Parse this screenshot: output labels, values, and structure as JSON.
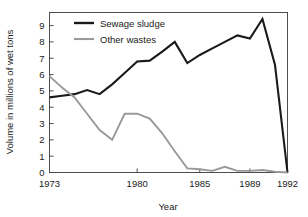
{
  "chart_data": {
    "type": "line",
    "title": "",
    "xlabel": "Year",
    "ylabel": "Volume in millions of wet tons",
    "xlim": [
      1973,
      1992
    ],
    "ylim": [
      0,
      9.8
    ],
    "grid": false,
    "legend_position": "top-left-inside",
    "xticks": [
      1973,
      1980,
      1985,
      1989,
      1992
    ],
    "xtick_labels": [
      "1973",
      "1980",
      "1985",
      "1989",
      "1992"
    ],
    "yticks": [
      0,
      1,
      2,
      3,
      4,
      5,
      6,
      7,
      8,
      9
    ],
    "ytick_labels": [
      "0",
      "1",
      "2",
      "3",
      "4",
      "5",
      "6",
      "7",
      "8",
      "9"
    ],
    "x": [
      1973,
      1974,
      1975,
      1976,
      1977,
      1978,
      1979,
      1980,
      1981,
      1982,
      1983,
      1984,
      1985,
      1986,
      1987,
      1988,
      1989,
      1990,
      1991,
      1992
    ],
    "series": [
      {
        "name": "Sewage sludge",
        "color": "#1a1a1a",
        "values": [
          4.6,
          4.7,
          4.8,
          5.05,
          4.8,
          5.4,
          6.1,
          6.8,
          6.85,
          7.4,
          8.0,
          6.7,
          7.2,
          7.6,
          8.0,
          8.4,
          8.2,
          9.4,
          6.6,
          0.0
        ]
      },
      {
        "name": "Other wastes",
        "color": "#999999",
        "values": [
          5.9,
          5.2,
          4.6,
          3.6,
          2.6,
          2.0,
          3.6,
          3.6,
          3.3,
          2.4,
          1.3,
          0.25,
          0.2,
          0.1,
          0.35,
          0.1,
          0.1,
          0.15,
          0.05,
          0.0
        ]
      }
    ],
    "legend": [
      {
        "label": "Sewage sludge",
        "color": "#1a1a1a"
      },
      {
        "label": "Other wastes",
        "color": "#999999"
      }
    ]
  }
}
